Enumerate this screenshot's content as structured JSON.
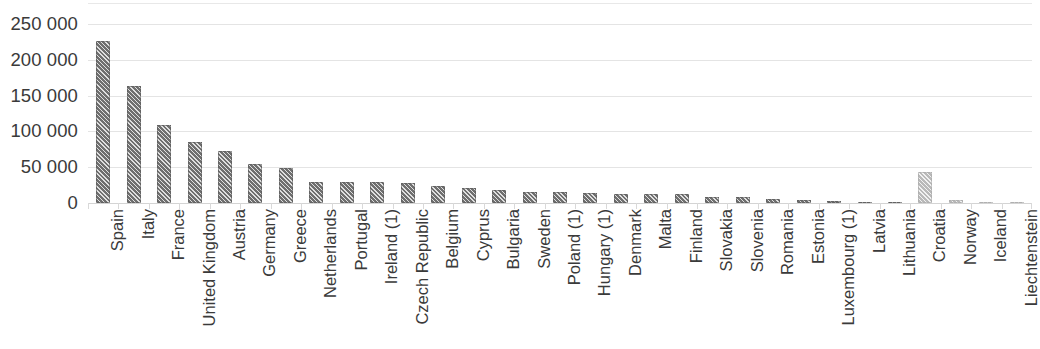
{
  "chart_data": {
    "type": "bar",
    "title": "",
    "subtitle": "",
    "xlabel": "",
    "ylabel": "",
    "ylim": [
      0,
      250000
    ],
    "yticks": [
      0,
      50000,
      100000,
      150000,
      200000,
      250000
    ],
    "ytick_labels": [
      "0",
      "50 000",
      "100 000",
      "150 000",
      "200 000",
      "250 000"
    ],
    "grid": true,
    "legend": "none",
    "thousands_separator": " ",
    "series": [
      {
        "name": "",
        "values": [
          226000,
          163000,
          109000,
          85000,
          72000,
          55000,
          49000,
          30000,
          30000,
          29000,
          28500,
          24000,
          21000,
          18000,
          16000,
          15000,
          14000,
          13000,
          12500,
          12000,
          8500,
          8000,
          5000,
          4000,
          3000,
          2000,
          1000,
          43000,
          4000,
          700,
          300
        ]
      }
    ],
    "categories": [
      "Spain",
      "Italy",
      "France",
      "United Kingdom",
      "Austria",
      "Germany",
      "Greece",
      "Netherlands",
      "Portugal",
      "Ireland (1)",
      "Czech Republic",
      "Belgium",
      "Cyprus",
      "Bulgaria",
      "Sweden",
      "Poland (1)",
      "Hungary (1)",
      "Denmark",
      "Malta",
      "Finland",
      "Slovakia",
      "Slovenia",
      "Romania",
      "Estonia",
      "Luxembourg (1)",
      "Latvia",
      "Lithuania",
      "Croatia",
      "Norway",
      "Iceland",
      "Liechtenstein"
    ],
    "bar_styles": [
      "dark",
      "dark",
      "dark",
      "dark",
      "dark",
      "dark",
      "dark",
      "dark",
      "dark",
      "dark",
      "dark",
      "dark",
      "dark",
      "dark",
      "dark",
      "dark",
      "dark",
      "dark",
      "dark",
      "dark",
      "dark",
      "dark",
      "dark",
      "dark",
      "dark",
      "dark",
      "dark",
      "light",
      "light",
      "light",
      "light"
    ],
    "colors": {
      "bar_dark": "#6f6f6f",
      "bar_light": "#b9b9b9",
      "gridline": "#e4e4e4",
      "axis": "#d4d4d4",
      "text": "#3a3a3a",
      "background": "#ffffff"
    }
  }
}
